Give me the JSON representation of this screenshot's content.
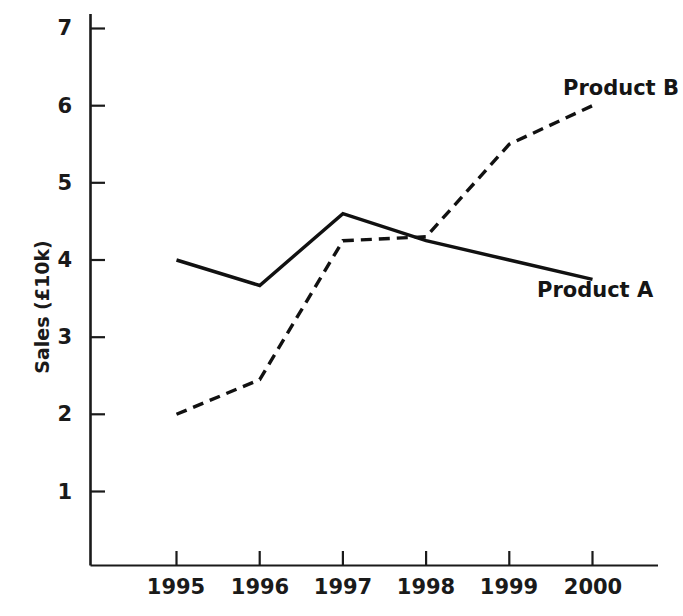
{
  "chart_data": {
    "type": "line",
    "title": "",
    "xlabel": "",
    "ylabel": "Sales (£10k)",
    "categories": [
      "1995",
      "1996",
      "1997",
      "1998",
      "1999",
      "2000"
    ],
    "x": [
      1995,
      1996,
      1997,
      1998,
      1999,
      2000
    ],
    "xlim": [
      1994.7,
      2000.4
    ],
    "ylim": [
      0,
      7.35
    ],
    "y_ticks": [
      1,
      2,
      3,
      4,
      5,
      6,
      7
    ],
    "y_tick_labels": [
      "1",
      "2",
      "3",
      "4",
      "5",
      "6",
      "7"
    ],
    "grid": false,
    "legend": "inline-annotations",
    "series": [
      {
        "name": "Product A",
        "style": "solid",
        "color": "#111111",
        "values": [
          4.0,
          3.67,
          4.6,
          4.25,
          4.0,
          3.75
        ],
        "label_position": "right-below"
      },
      {
        "name": "Product B",
        "style": "dashed",
        "color": "#111111",
        "values": [
          2.0,
          2.45,
          4.25,
          4.3,
          5.5,
          6.0
        ],
        "label_position": "right-above"
      }
    ],
    "annotations": [
      {
        "text": "Product A",
        "x": 2000,
        "y": 3.45
      },
      {
        "text": "Product B",
        "x": 2000,
        "y": 6.25
      }
    ]
  },
  "axes": {
    "y_axis_name": "Sales (£10k)",
    "y_tick_labels": [
      "7",
      "6",
      "5",
      "4",
      "3",
      "2",
      "1"
    ],
    "x_tick_labels": [
      "1995",
      "1996",
      "1997",
      "1998",
      "1999",
      "2000"
    ]
  },
  "labels": {
    "product_a": "Product A",
    "product_b": "Product B"
  }
}
